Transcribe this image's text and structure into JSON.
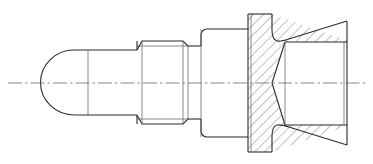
{
  "document": {
    "type": "engineering-drawing",
    "view": "half-section side elevation",
    "title": "Stepped pin with hex flange and internal conical bore",
    "background_color": "#ffffff",
    "line_color": "#2b2b2b",
    "centerline_color": "#6a6a6a",
    "hatch_color": "#3a3a3a",
    "canvas": {
      "width": 373,
      "height": 164
    }
  },
  "geometry": {
    "axis_y": 83,
    "features": [
      {
        "name": "spherical-nose",
        "label": "Rounded dome nose",
        "x_start": 55,
        "x_end": 88,
        "top_y": 50,
        "bottom_y": 115,
        "sectioned": false
      },
      {
        "name": "nose-cylinder",
        "label": "Plain cylindrical shank",
        "x_start": 88,
        "x_end": 137,
        "top_y": 50,
        "bottom_y": 115,
        "sectioned": false
      },
      {
        "name": "threaded-section",
        "label": "External thread",
        "x_start": 137,
        "x_end": 188,
        "top_y": 41,
        "bottom_y": 124,
        "minor_top_y": 46,
        "minor_bottom_y": 119,
        "chamfer": 5,
        "sectioned": false
      },
      {
        "name": "thread-relief",
        "label": "Undercut relief collar",
        "x_start": 188,
        "x_end": 201,
        "top_y": 46,
        "bottom_y": 119,
        "sectioned": false
      },
      {
        "name": "body-shoulder",
        "label": "Shoulder body",
        "x_start": 201,
        "x_end": 248,
        "top_y": 29,
        "bottom_y": 137,
        "corner_radius": 6,
        "sectioned": false
      },
      {
        "name": "flange-head",
        "label": "Flange head (sectioned)",
        "x_start": 248,
        "x_end": 272,
        "top_y": 14,
        "bottom_y": 152,
        "sectioned": true
      },
      {
        "name": "tapered-skirt",
        "label": "Tapered skirt (sectioned)",
        "x_start": 272,
        "x_end": 347,
        "top_y_start": 14,
        "top_y_end": 42,
        "bottom_y_start": 152,
        "bottom_y_end": 125,
        "sectioned": true
      },
      {
        "name": "internal-bore",
        "label": "Cylindrical internal bore",
        "x_start": 285,
        "x_end": 347,
        "top_y": 42,
        "bottom_y": 125
      },
      {
        "name": "conical-bore-point",
        "label": "120 degree conical bore end",
        "apex_x": 272,
        "apex_y": 83,
        "mouth_x": 285,
        "mouth_top_y": 42,
        "mouth_bottom_y": 125
      }
    ],
    "centerline": {
      "x_start": 8,
      "x_end": 366,
      "y": 83
    },
    "hatching": {
      "style": "45-degree parallel section lines",
      "spacing_px": 7,
      "angle_deg": 45
    }
  },
  "annotations": {
    "labels": [],
    "dimensions": [],
    "notes": []
  }
}
